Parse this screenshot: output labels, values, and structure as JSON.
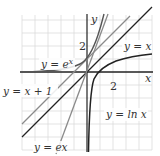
{
  "figure": {
    "axis_labels": {
      "x": "x",
      "y": "y"
    },
    "ticks": {
      "x_tick": "2",
      "y_tick": "2"
    },
    "curves": [
      {
        "id": "exp",
        "label": "y = e",
        "label_sup": "x",
        "color": "#555555"
      },
      {
        "id": "ln",
        "label": "y = ln x",
        "color": "#222222"
      },
      {
        "id": "identity",
        "label": "y = x",
        "color": "#222222"
      },
      {
        "id": "tangent_exp",
        "label": "y = x + 1",
        "color": "#8a8a8a"
      },
      {
        "id": "tangent_ln",
        "label": "y = ex",
        "color": "#8a8a8a"
      }
    ],
    "colors": {
      "grid": "#dcdcdc",
      "axis": "#222222"
    }
  }
}
